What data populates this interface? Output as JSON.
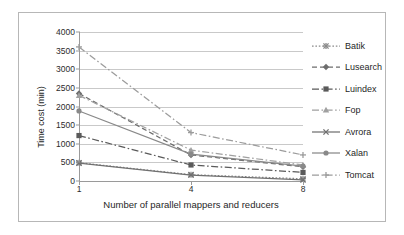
{
  "chart_data": {
    "type": "line",
    "title": "",
    "xlabel": "Number of parallel mappers and reducers",
    "ylabel": "Time cost (min)",
    "categories": [
      "1",
      "4",
      "8"
    ],
    "x": [
      1,
      4,
      8
    ],
    "ylim": [
      0,
      4000
    ],
    "ytick_step": 500,
    "yticks": [
      "0",
      "500",
      "1000",
      "1500",
      "2000",
      "2500",
      "3000",
      "3500",
      "4000"
    ],
    "grid": true,
    "legend_position": "right",
    "series": [
      {
        "name": "Batik",
        "values": [
          490,
          170,
          60
        ],
        "marker": "asterisk",
        "line_style": "dotted",
        "color": "#8a8a8a"
      },
      {
        "name": "Lusearch",
        "values": [
          2350,
          700,
          380
        ],
        "marker": "diamond",
        "line_style": "dashed",
        "color": "#6d6d6d"
      },
      {
        "name": "Luindex",
        "values": [
          1220,
          430,
          230
        ],
        "marker": "square",
        "line_style": "dash-dot",
        "color": "#5a5a5a"
      },
      {
        "name": "Fop",
        "values": [
          2300,
          830,
          430
        ],
        "marker": "triangle",
        "line_style": "dash-dot",
        "color": "#a0a0a0"
      },
      {
        "name": "Avrora",
        "values": [
          480,
          160,
          30
        ],
        "marker": "x",
        "line_style": "solid",
        "color": "#707070"
      },
      {
        "name": "Xalan",
        "values": [
          1880,
          720,
          400
        ],
        "marker": "circle",
        "line_style": "solid",
        "color": "#898989"
      },
      {
        "name": "Tomcat",
        "values": [
          3600,
          1300,
          700
        ],
        "marker": "plus",
        "line_style": "dash-dot",
        "color": "#9c9c9c"
      }
    ]
  }
}
